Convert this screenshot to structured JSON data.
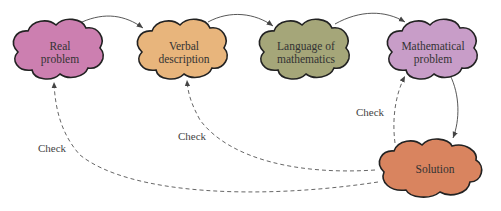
{
  "diagram": {
    "nodes": [
      {
        "id": "real",
        "label_lines": [
          "Real",
          "problem"
        ],
        "color": "#cc7fb0"
      },
      {
        "id": "verbal",
        "label_lines": [
          "Verbal",
          "description"
        ],
        "color": "#e8b57c"
      },
      {
        "id": "language",
        "label_lines": [
          "Language of",
          "mathematics"
        ],
        "color": "#a5a679"
      },
      {
        "id": "math",
        "label_lines": [
          "Mathematical",
          "problem"
        ],
        "color": "#c89dc8"
      },
      {
        "id": "solution",
        "label_lines": [
          "Solution"
        ],
        "color": "#d9845f"
      }
    ],
    "edges": [
      {
        "from": "real",
        "to": "verbal",
        "style": "solid"
      },
      {
        "from": "verbal",
        "to": "language",
        "style": "solid"
      },
      {
        "from": "language",
        "to": "math",
        "style": "solid"
      },
      {
        "from": "math",
        "to": "solution",
        "style": "solid"
      },
      {
        "from": "solution",
        "to": "math",
        "style": "dashed",
        "label": "Check"
      },
      {
        "from": "solution",
        "to": "verbal",
        "style": "dashed",
        "label": "Check"
      },
      {
        "from": "solution",
        "to": "real",
        "style": "dashed",
        "label": "Check"
      }
    ],
    "check_label": "Check"
  }
}
